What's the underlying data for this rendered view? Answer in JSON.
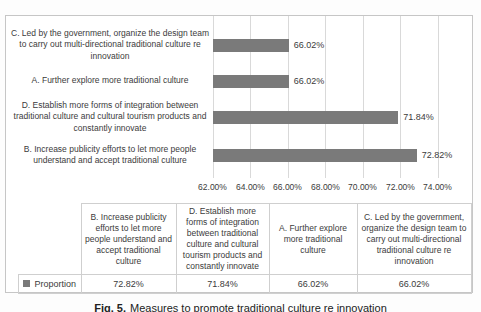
{
  "chart_data": {
    "type": "bar",
    "orientation": "horizontal",
    "categories": [
      "C. Led by the government, organize the design team to carry out multi-directional traditional culture re innovation",
      "A. Further explore more traditional culture",
      "D. Establish more forms of integration between traditional culture and cultural tourism products and constantly innovate",
      "B. Increase publicity efforts to let more people understand and accept traditional culture"
    ],
    "series": [
      {
        "name": "Proportion",
        "values": [
          66.02,
          66.02,
          71.84,
          72.82
        ]
      }
    ],
    "value_labels": [
      "66.02%",
      "66.02%",
      "71.84%",
      "72.82%"
    ],
    "x_ticks": [
      "62.00%",
      "64.00%",
      "66.00%",
      "68.00%",
      "70.00%",
      "72.00%",
      "74.00%"
    ],
    "xlim": [
      62,
      74
    ],
    "grid": true,
    "legend_position": "in-table",
    "bar_color": "#7a7a7a"
  },
  "table": {
    "row_label": "Proportion",
    "columns": [
      "B. Increase publicity efforts to let more people understand and accept traditional culture",
      "D. Establish more forms of integration between traditional culture and cultural tourism products and constantly innovate",
      "A. Further explore more traditional culture",
      "C. Led by the government, organize the design team to carry out multi-directional traditional culture re innovation"
    ],
    "values": [
      "72.82%",
      "71.84%",
      "66.02%",
      "66.02%"
    ]
  },
  "caption": {
    "prefix": "Fig. 5.",
    "text": "Measures to promote traditional culture re innovation"
  }
}
